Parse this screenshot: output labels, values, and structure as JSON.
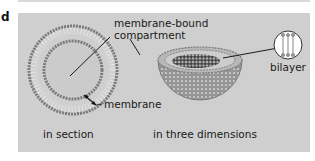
{
  "panel_letter": "d",
  "labels": {
    "compartment_line1": "membrane-bound",
    "compartment_line2": "compartment",
    "membrane": "membrane",
    "bilayer": "bilayer",
    "in_section": "in section",
    "in_three_dimensions": "in three dimensions"
  },
  "colors": {
    "panel_background": "#cfcfcf",
    "bead": "#8a8a8a",
    "bead_dark": "#3a3a3a",
    "interior": "#c8c8c8",
    "text": "#1a1a1a"
  }
}
